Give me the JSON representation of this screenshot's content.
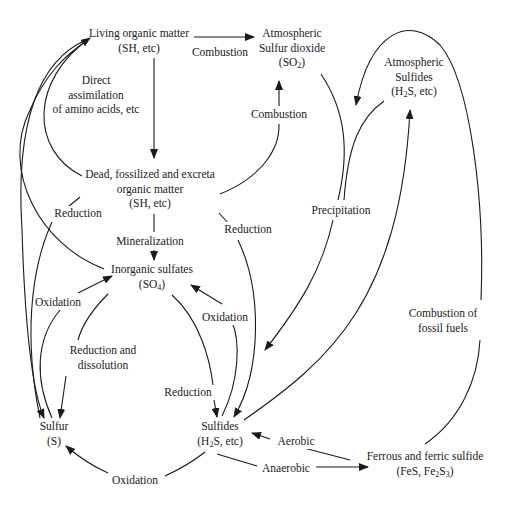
{
  "diagram": {
    "nodes": {
      "living_organic": {
        "line1": "Living organic matter",
        "line2": "(SH, etc)"
      },
      "atm_so2": {
        "line1": "Atmospheric",
        "line2": "Sulfur dioxide",
        "line3_pre": "(SO",
        "line3_sub": "2",
        "line3_post": ")"
      },
      "atm_sulfides": {
        "line1": "Atmospheric",
        "line2": "Sulfides",
        "line3_pre": "(H",
        "line3_sub": "2",
        "line3_post": "S, etc)"
      },
      "dead_organic": {
        "line1": "Dead, fossilized and excreta",
        "line2": "organic matter",
        "line3": "(SH, etc)"
      },
      "inorganic_sulfates": {
        "line1": "Inorganic sulfates",
        "line2_pre": "(SO",
        "line2_sub": "4",
        "line2_post": ")"
      },
      "sulfur": {
        "line1": "Sulfur",
        "line2": "(S)"
      },
      "sulfides": {
        "line1": "Sulfides",
        "line2_pre": "(H",
        "line2_sub": "2",
        "line2_post": "S, etc)"
      },
      "ferrous_ferric": {
        "line1": "Ferrous and ferric sulfide",
        "line2_pre": "(FeS, Fe",
        "line2_sub1": "2",
        "line2_mid": "S",
        "line2_sub2": "3",
        "line2_post": ")"
      }
    },
    "edge_labels": {
      "combustion_top": "Combustion",
      "direct_assimilation": {
        "line1": "Direct",
        "line2": "assimilation",
        "line3": "of amino acids, etc"
      },
      "combustion_mid": "Combustion",
      "reduction_left": "Reduction",
      "reduction_mid": "Reduction",
      "precipitation": "Precipitation",
      "mineralization": "Mineralization",
      "oxidation_left": "Oxidation",
      "oxidation_right": "Oxidation",
      "combustion_fossil": {
        "line1": "Combustion of",
        "line2": "fossil fuels"
      },
      "reduction_dissolution": {
        "line1": "Reduction and",
        "line2": "dissolution"
      },
      "reduction_bottom": "Reduction",
      "aerobic": "Aerobic",
      "anaerobic": "Anaerobic",
      "oxidation_bottom": "Oxidation"
    },
    "edges": [
      {
        "from": "Living organic matter",
        "to": "Atmospheric Sulfur dioxide",
        "label": "Combustion"
      },
      {
        "from": "Living organic matter",
        "to": "Dead, fossilized and excreta organic matter",
        "label": "Direct assimilation of amino acids, etc"
      },
      {
        "from": "Dead, fossilized and excreta organic matter",
        "to": "Living organic matter",
        "label": ""
      },
      {
        "from": "Dead, fossilized and excreta organic matter",
        "to": "Atmospheric Sulfur dioxide",
        "label": "Combustion"
      },
      {
        "from": "Dead, fossilized and excreta organic matter",
        "to": "Inorganic sulfates",
        "label": "Mineralization"
      },
      {
        "from": "Dead, fossilized and excreta organic matter",
        "to": "Sulfur",
        "label": "Reduction"
      },
      {
        "from": "Dead, fossilized and excreta organic matter",
        "to": "Sulfides",
        "label": "Reduction"
      },
      {
        "from": "Inorganic sulfates",
        "to": "Living organic matter",
        "label": ""
      },
      {
        "from": "Atmospheric Sulfur dioxide",
        "to": "Sulfides",
        "label": "Precipitation"
      },
      {
        "from": "Atmospheric Sulfides",
        "to": "Sulfides",
        "label": "Precipitation"
      },
      {
        "from": "Sulfides",
        "to": "Atmospheric Sulfides",
        "label": ""
      },
      {
        "from": "Ferrous and ferric sulfide",
        "to": "Atmospheric Sulfides",
        "label": "Combustion of fossil fuels"
      },
      {
        "from": "Sulfur",
        "to": "Inorganic sulfates",
        "label": "Oxidation"
      },
      {
        "from": "Inorganic sulfates",
        "to": "Sulfur",
        "label": "Reduction and dissolution"
      },
      {
        "from": "Sulfides",
        "to": "Inorganic sulfates",
        "label": "Oxidation"
      },
      {
        "from": "Inorganic sulfates",
        "to": "Sulfides",
        "label": "Reduction"
      },
      {
        "from": "Sulfides",
        "to": "Sulfur",
        "label": "Oxidation"
      },
      {
        "from": "Ferrous and ferric sulfide",
        "to": "Sulfides",
        "label": "Aerobic"
      },
      {
        "from": "Sulfides",
        "to": "Ferrous and ferric sulfide",
        "label": "Anaerobic"
      },
      {
        "from": "Living organic matter",
        "to": "Sulfur",
        "label": ""
      }
    ],
    "colors": {
      "ink": "#1a1a1a",
      "background": "#ffffff"
    }
  }
}
